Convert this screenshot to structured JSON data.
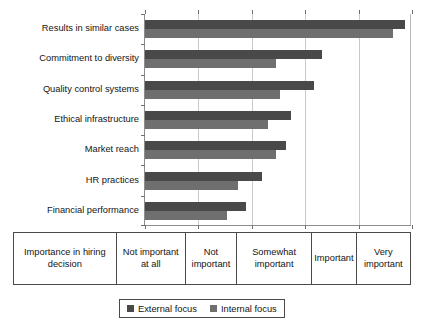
{
  "chart_data": {
    "type": "bar",
    "orientation": "horizontal",
    "title": "",
    "xlabel": "Importance in hiring decision",
    "ylabel": "",
    "grid": true,
    "legend_position": "bottom",
    "x_axis_type": "categorical-scale",
    "x_tick_labels": [
      "Not important at all",
      "Not important",
      "Somewhat important",
      "Important",
      "Very important"
    ],
    "xlim": [
      0,
      5
    ],
    "categories": [
      "Results in similar cases",
      "Commitment to diversity",
      "Quality control systems",
      "Ethical infrastructure",
      "Market reach",
      "HR practices",
      "Financial performance"
    ],
    "series": [
      {
        "name": "External focus",
        "color": "#494949",
        "values": [
          4.87,
          3.31,
          3.16,
          2.73,
          2.64,
          2.19,
          1.89
        ]
      },
      {
        "name": "Internal focus",
        "color": "#6f6f6f",
        "values": [
          4.64,
          2.45,
          2.53,
          2.3,
          2.45,
          1.74,
          1.53
        ]
      }
    ]
  },
  "axis_table": {
    "row_label": "Importance in hiring decision",
    "cells": [
      "Not important at all",
      "Not important",
      "Somewhat important",
      "Important",
      "Very important"
    ]
  },
  "legend": {
    "items": [
      {
        "label": "External focus",
        "swatch": "external"
      },
      {
        "label": "Internal focus",
        "swatch": "internal"
      }
    ]
  }
}
